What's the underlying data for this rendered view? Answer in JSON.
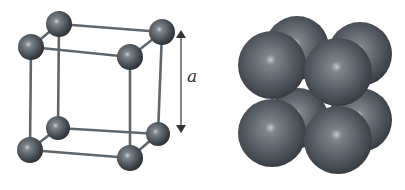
{
  "figure": {
    "colors": {
      "background": "#ffffff",
      "atom_base": "#4a5158",
      "atom_highlight": "#c8ccd0",
      "atom_shadow": "#23282d",
      "bond": "#5f666c",
      "arrow": "#333333"
    },
    "lattice_label": "a",
    "ball_and_stick": {
      "atom_radius": 13,
      "atoms": [
        {
          "id": "btl",
          "x": 59,
          "y": 24,
          "r": 13
        },
        {
          "id": "btr",
          "x": 162,
          "y": 32,
          "r": 13
        },
        {
          "id": "bbl",
          "x": 58,
          "y": 128,
          "r": 12
        },
        {
          "id": "bbr",
          "x": 158,
          "y": 134,
          "r": 12
        },
        {
          "id": "ftl",
          "x": 31,
          "y": 47,
          "r": 13
        },
        {
          "id": "ftr",
          "x": 130,
          "y": 57,
          "r": 13
        },
        {
          "id": "fbl",
          "x": 30,
          "y": 150,
          "r": 13
        },
        {
          "id": "fbr",
          "x": 130,
          "y": 158,
          "r": 13
        }
      ],
      "bonds": [
        [
          "btl",
          "btr"
        ],
        [
          "btl",
          "bbl"
        ],
        [
          "btr",
          "bbr"
        ],
        [
          "bbl",
          "bbr"
        ],
        [
          "ftl",
          "ftr"
        ],
        [
          "ftl",
          "fbl"
        ],
        [
          "ftr",
          "fbr"
        ],
        [
          "fbl",
          "fbr"
        ],
        [
          "btl",
          "ftl"
        ],
        [
          "btr",
          "ftr"
        ],
        [
          "bbl",
          "fbl"
        ],
        [
          "bbr",
          "fbr"
        ]
      ]
    },
    "dimension_arrow": {
      "x": 181,
      "y1": 30,
      "y2": 133,
      "label_x": 187,
      "label_y": 82
    },
    "space_filling": {
      "spheres": [
        {
          "id": "bbl",
          "x": 298,
          "y": 118,
          "r": 30
        },
        {
          "id": "bbr",
          "x": 360,
          "y": 120,
          "r": 32
        },
        {
          "id": "btl",
          "x": 297,
          "y": 48,
          "r": 32
        },
        {
          "id": "btr",
          "x": 360,
          "y": 54,
          "r": 32
        },
        {
          "id": "fbl",
          "x": 272,
          "y": 133,
          "r": 34
        },
        {
          "id": "fbr",
          "x": 338,
          "y": 140,
          "r": 34
        },
        {
          "id": "ftl",
          "x": 272,
          "y": 65,
          "r": 34
        },
        {
          "id": "ftr",
          "x": 338,
          "y": 72,
          "r": 34
        }
      ]
    }
  }
}
